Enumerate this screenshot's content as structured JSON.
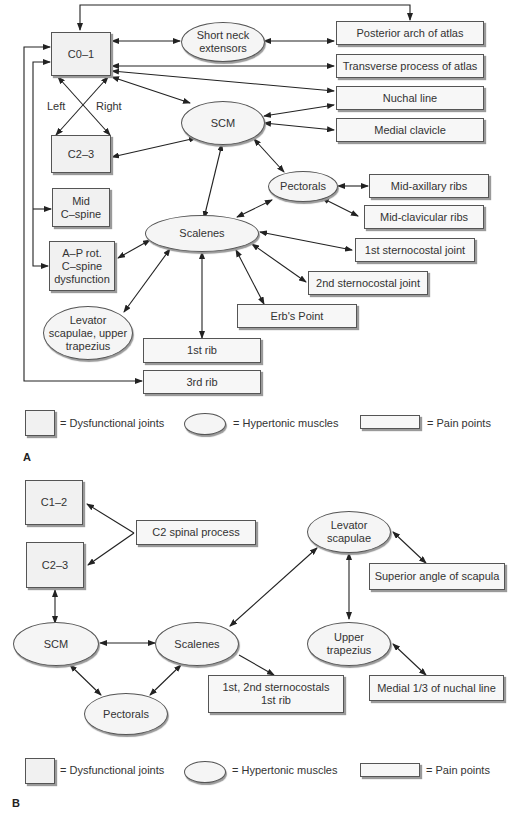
{
  "panelA": {
    "label": "A",
    "joints": {
      "c01": "C0–1",
      "c23": "C2–3",
      "mid_cspine": "Mid\nC–spine",
      "ap_rot": "A–P rot.\nC–spine\ndysfunction"
    },
    "muscles": {
      "short_neck": "Short neck\nextensors",
      "scm": "SCM",
      "pectorals": "Pectorals",
      "scalenes": "Scalenes",
      "levator_trap": "Levator\nscapulae, upper\ntrapezius"
    },
    "pain_points": {
      "posterior_arch": "Posterior arch of atlas",
      "transverse_process": "Transverse process of atlas",
      "nuchal_line": "Nuchal line",
      "medial_clavicle": "Medial clavicle",
      "mid_axillary": "Mid-axillary ribs",
      "mid_clavicular": "Mid-clavicular ribs",
      "first_sternocostal": "1st sternocostal joint",
      "second_sternocostal": "2nd sternocostal joint",
      "erbs_point": "Erb's Point",
      "first_rib": "1st rib",
      "third_rib": "3rd rib"
    },
    "side_labels": {
      "left": "Left",
      "right": "Right"
    }
  },
  "panelB": {
    "label": "B",
    "joints": {
      "c12": "C1–2",
      "c23": "C2–3"
    },
    "muscles": {
      "scm": "SCM",
      "scalenes": "Scalenes",
      "pectorals": "Pectorals",
      "levator": "Levator\nscapulae",
      "upper_trap": "Upper\ntrapezius"
    },
    "pain_points": {
      "c2_spinal": "C2 spinal process",
      "superior_angle": "Superior angle of scapula",
      "sternocostals": "1st, 2nd sternocostals\n1st rib",
      "medial_nuchal": "Medial 1/3 of nuchal line"
    }
  },
  "legend": {
    "joints": "= Dysfunctional joints",
    "muscles": "= Hypertonic muscles",
    "pain": "= Pain points"
  }
}
